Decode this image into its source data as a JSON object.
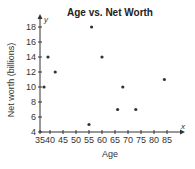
{
  "chart_data": {
    "type": "scatter",
    "title": "Age vs. Net Worth",
    "xlabel": "Age",
    "ylabel": "Net worth (billions)",
    "x_axis_letter": "x",
    "y_axis_letter": "y",
    "xlim": [
      35,
      90
    ],
    "ylim": [
      4,
      19
    ],
    "x_ticks": [
      35,
      40,
      45,
      50,
      55,
      60,
      65,
      70,
      75,
      80,
      85
    ],
    "y_ticks": [
      4,
      6,
      8,
      10,
      12,
      14,
      16,
      18
    ],
    "grid": false,
    "legend": null,
    "x_axis_break": true,
    "points": [
      {
        "x": 37,
        "y": 10
      },
      {
        "x": 39,
        "y": 14
      },
      {
        "x": 42,
        "y": 12
      },
      {
        "x": 55,
        "y": 5
      },
      {
        "x": 56,
        "y": 18
      },
      {
        "x": 60,
        "y": 14
      },
      {
        "x": 66,
        "y": 7
      },
      {
        "x": 68,
        "y": 10
      },
      {
        "x": 73,
        "y": 7
      },
      {
        "x": 84,
        "y": 11
      }
    ],
    "colors": {
      "axis": "#333333",
      "point": "#333333",
      "text": "#333333"
    }
  }
}
